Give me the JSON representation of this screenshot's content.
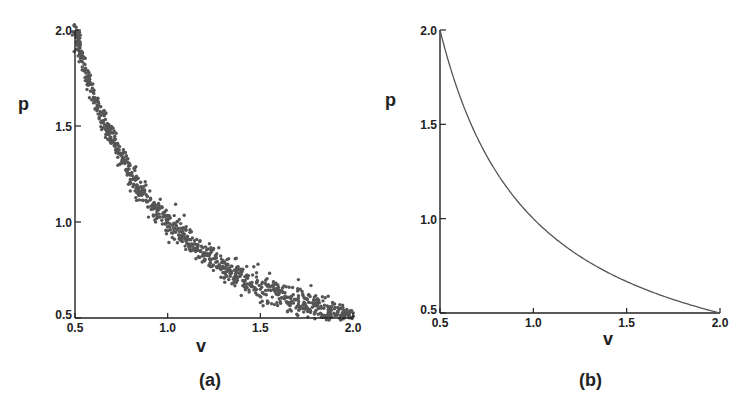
{
  "figure": {
    "panels": [
      {
        "id": "a",
        "caption": "(a)",
        "xlabel": "v",
        "ylabel": "p",
        "kind": "scatter"
      },
      {
        "id": "b",
        "caption": "(b)",
        "xlabel": "v",
        "ylabel": "p",
        "kind": "line"
      }
    ],
    "colors": {
      "points": "#555555",
      "axis": "#222222",
      "curve": "#555555"
    }
  },
  "chart_data": [
    {
      "type": "scatter",
      "title": "(a)",
      "xlabel": "v",
      "ylabel": "p",
      "xlim": [
        0.5,
        2.0
      ],
      "ylim": [
        0.5,
        2.0
      ],
      "xticks": [
        "0.5",
        "1.0",
        "1.5",
        "2.0"
      ],
      "yticks": [
        "0.5",
        "1.0",
        "1.5",
        "2.0"
      ],
      "grid": false,
      "legend": null,
      "description": "Noisy samples (~1000 points) scattered around the curve p = 1/v",
      "relation": "p*v = 1 (with noise, std ~0.04)",
      "n_points": 1000,
      "sample_points": [
        {
          "v": 0.5,
          "p": 2.0
        },
        {
          "v": 0.6,
          "p": 1.67
        },
        {
          "v": 0.7,
          "p": 1.43
        },
        {
          "v": 0.8,
          "p": 1.25
        },
        {
          "v": 0.9,
          "p": 1.11
        },
        {
          "v": 1.0,
          "p": 1.0
        },
        {
          "v": 1.2,
          "p": 0.83
        },
        {
          "v": 1.4,
          "p": 0.71
        },
        {
          "v": 1.6,
          "p": 0.63
        },
        {
          "v": 1.8,
          "p": 0.56
        },
        {
          "v": 2.0,
          "p": 0.5
        }
      ]
    },
    {
      "type": "line",
      "title": "(b)",
      "xlabel": "v",
      "ylabel": "p",
      "xlim": [
        0.5,
        2.0
      ],
      "ylim": [
        0.5,
        2.0
      ],
      "xticks": [
        "0.5",
        "1.0",
        "1.5",
        "2.0"
      ],
      "yticks": [
        "0.5",
        "1.0",
        "1.5",
        "2.0"
      ],
      "grid": false,
      "legend": null,
      "relation": "p = 1/v",
      "x": [
        0.5,
        0.6,
        0.7,
        0.8,
        0.9,
        1.0,
        1.2,
        1.4,
        1.6,
        1.8,
        2.0
      ],
      "y": [
        2.0,
        1.667,
        1.429,
        1.25,
        1.111,
        1.0,
        0.833,
        0.714,
        0.625,
        0.556,
        0.5
      ]
    }
  ]
}
